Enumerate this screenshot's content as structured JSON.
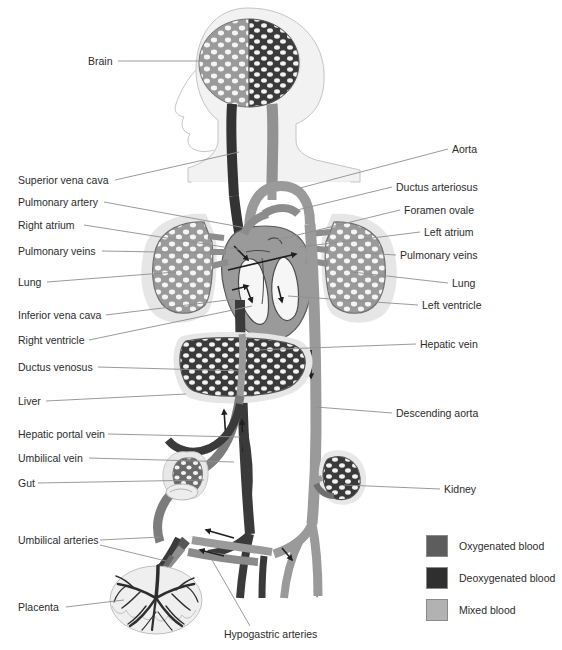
{
  "figure": {
    "type": "anatomical-diagram"
  },
  "colors": {
    "oxygenated": "#5d5d5d",
    "deoxygenated": "#2f2f2f",
    "mixed": "#9a9a9a",
    "body_outline": "#b9b9b9",
    "body_fill": "#f2f2f2",
    "organ_halo": "#e4e4e4",
    "leader_line": "#8f8f8f",
    "text": "#2b2b2b",
    "background": "#ffffff"
  },
  "labels_left": [
    {
      "text": "Brain",
      "x": 88,
      "y": 55,
      "lx": 118,
      "ly": 61,
      "tx": 214,
      "ty": 61
    },
    {
      "text": "Superior vena cava",
      "x": 18,
      "y": 174,
      "lx": 115,
      "ly": 180,
      "tx": 239,
      "ty": 152
    },
    {
      "text": "Pulmonary artery",
      "x": 18,
      "y": 196,
      "lx": 104,
      "ly": 202,
      "tx": 246,
      "ty": 228
    },
    {
      "text": "Right atrium",
      "x": 18,
      "y": 219,
      "lx": 84,
      "ly": 225,
      "tx": 243,
      "ty": 250
    },
    {
      "text": "Pulmonary veins",
      "x": 18,
      "y": 245,
      "lx": 102,
      "ly": 251,
      "tx": 217,
      "ty": 253
    },
    {
      "text": "Lung",
      "x": 18,
      "y": 276,
      "lx": 47,
      "ly": 282,
      "tx": 176,
      "ty": 272
    },
    {
      "text": "Inferior vena cava",
      "x": 18,
      "y": 309,
      "lx": 106,
      "ly": 315,
      "tx": 236,
      "ty": 299
    },
    {
      "text": "Right ventricle",
      "x": 18,
      "y": 334,
      "lx": 89,
      "ly": 340,
      "tx": 252,
      "ty": 306
    },
    {
      "text": "Ductus venosus",
      "x": 18,
      "y": 361,
      "lx": 98,
      "ly": 367,
      "tx": 244,
      "ty": 371
    },
    {
      "text": "Liver",
      "x": 18,
      "y": 395,
      "lx": 46,
      "ly": 401,
      "tx": 186,
      "ty": 394
    },
    {
      "text": "Hepatic portal vein",
      "x": 18,
      "y": 428,
      "lx": 108,
      "ly": 434,
      "tx": 240,
      "ty": 437
    },
    {
      "text": "Umbilical vein",
      "x": 18,
      "y": 452,
      "lx": 89,
      "ly": 458,
      "tx": 234,
      "ty": 462
    },
    {
      "text": "Gut",
      "x": 18,
      "y": 477,
      "lx": 38,
      "ly": 483,
      "tx": 204,
      "ty": 480
    },
    {
      "text": "Umbilical arteries",
      "x": 18,
      "y": 534,
      "lx": 100,
      "ly": 540,
      "tx": 161,
      "ty": 537
    },
    {
      "text": "Placenta",
      "x": 18,
      "y": 601,
      "lx": 66,
      "ly": 607,
      "tx": 124,
      "ty": 600
    }
  ],
  "labels_left_second_leader": [
    {
      "from_text": "Umbilical arteries",
      "lx": 100,
      "ly": 545,
      "tx": 166,
      "ty": 561
    }
  ],
  "labels_right": [
    {
      "text": "Aorta",
      "x": 452,
      "y": 143,
      "lx": 448,
      "ly": 149,
      "tx": 300,
      "ty": 188
    },
    {
      "text": "Ductus arteriosus",
      "x": 396,
      "y": 181,
      "lx": 392,
      "ly": 187,
      "tx": 293,
      "ty": 211
    },
    {
      "text": "Foramen ovale",
      "x": 404,
      "y": 204,
      "lx": 400,
      "ly": 210,
      "tx": 277,
      "ty": 240
    },
    {
      "text": "Left atrium",
      "x": 424,
      "y": 226,
      "lx": 420,
      "ly": 232,
      "tx": 300,
      "ty": 247
    },
    {
      "text": "Pulmonary veins",
      "x": 400,
      "y": 249,
      "lx": 396,
      "ly": 255,
      "tx": 348,
      "ty": 252
    },
    {
      "text": "Lung",
      "x": 452,
      "y": 277,
      "lx": 448,
      "ly": 283,
      "tx": 352,
      "ty": 272
    },
    {
      "text": "Left ventricle",
      "x": 422,
      "y": 299,
      "lx": 418,
      "ly": 305,
      "tx": 288,
      "ty": 296
    },
    {
      "text": "Hepatic vein",
      "x": 420,
      "y": 338,
      "lx": 416,
      "ly": 344,
      "tx": 256,
      "ty": 350
    },
    {
      "text": "Descending aorta",
      "x": 396,
      "y": 407,
      "lx": 392,
      "ly": 413,
      "tx": 316,
      "ty": 407
    },
    {
      "text": "Kidney",
      "x": 444,
      "y": 483,
      "lx": 440,
      "ly": 489,
      "tx": 344,
      "ty": 485
    }
  ],
  "labels_bottom": [
    {
      "text": "Hypogastric arteries",
      "x": 224,
      "y": 628,
      "lx": 250,
      "ly": 626,
      "tx": 212,
      "ty": 560
    }
  ],
  "legend": {
    "items": [
      {
        "label": "Oxygenated blood",
        "color": "#5d5d5d"
      },
      {
        "label": "Deoxygenated blood",
        "color": "#2f2f2f"
      },
      {
        "label": "Mixed blood",
        "color": "#b2b2b2"
      }
    ]
  }
}
